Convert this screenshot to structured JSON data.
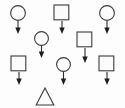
{
  "diagram": {
    "canvas": {
      "width": 125,
      "height": 108,
      "background": "#fdfdfd"
    },
    "colors": {
      "shape_stroke": "#3a3a3a",
      "shape_fill": "#fbfbfb",
      "arrow_fill": "#1d1d1d",
      "arrow_stroke": "#2b2b2b"
    },
    "nodes": [
      {
        "id": "node-1",
        "icon": "circle-with-down-arrow-icon",
        "shape": "circle",
        "label": "",
        "has_arrow": true,
        "arrow_direction": "down",
        "x": 9,
        "y": 4,
        "size": 16,
        "arrow_length": 13
      },
      {
        "id": "node-2",
        "icon": "square-with-down-arrow-icon",
        "shape": "square",
        "label": "",
        "has_arrow": true,
        "arrow_direction": "down",
        "x": 53,
        "y": 4,
        "size": 16,
        "arrow_length": 13
      },
      {
        "id": "node-3",
        "icon": "circle-with-down-arrow-icon",
        "shape": "circle",
        "label": "",
        "has_arrow": true,
        "arrow_direction": "down",
        "x": 98,
        "y": 4,
        "size": 16,
        "arrow_length": 13
      },
      {
        "id": "node-4",
        "icon": "circle-with-down-arrow-icon",
        "shape": "circle",
        "label": "",
        "has_arrow": true,
        "arrow_direction": "down",
        "x": 33,
        "y": 30,
        "size": 15,
        "arrow_length": 12
      },
      {
        "id": "node-5",
        "icon": "square-with-down-arrow-icon",
        "shape": "square",
        "label": "",
        "has_arrow": true,
        "arrow_direction": "down",
        "x": 76,
        "y": 31,
        "size": 16,
        "arrow_length": 15
      },
      {
        "id": "node-6",
        "icon": "square-with-down-arrow-icon",
        "shape": "square",
        "label": "",
        "has_arrow": true,
        "arrow_direction": "down",
        "x": 10,
        "y": 55,
        "size": 16,
        "arrow_length": 13
      },
      {
        "id": "node-7",
        "icon": "circle-with-down-arrow-icon",
        "shape": "circle",
        "label": "",
        "has_arrow": true,
        "arrow_direction": "down",
        "x": 55,
        "y": 56,
        "size": 15,
        "arrow_length": 13
      },
      {
        "id": "node-8",
        "icon": "square-with-down-arrow-icon",
        "shape": "square",
        "label": "",
        "has_arrow": true,
        "arrow_direction": "down",
        "x": 98,
        "y": 55,
        "size": 16,
        "arrow_length": 13
      },
      {
        "id": "node-9",
        "icon": "triangle-icon",
        "shape": "triangle",
        "label": "",
        "has_arrow": false,
        "arrow_direction": "",
        "x": 35,
        "y": 87,
        "size": 18,
        "arrow_length": 0
      }
    ]
  }
}
